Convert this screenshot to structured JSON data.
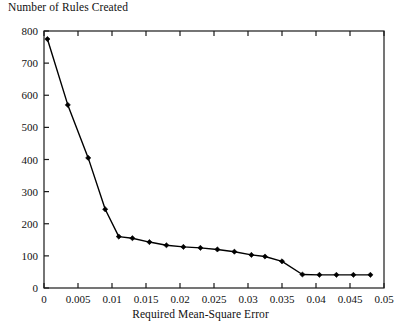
{
  "chart_data": {
    "type": "line",
    "title": "Number of Rules Created",
    "xlabel": "Required Mean-Square Error",
    "ylabel": "Number of Rules Created",
    "xlim": [
      0,
      0.05
    ],
    "ylim": [
      0,
      800
    ],
    "grid": false,
    "legend": null,
    "marker": "filled-diamond",
    "line_color": "#000000",
    "xticks": [
      0,
      0.005,
      0.01,
      0.015,
      0.02,
      0.025,
      0.03,
      0.035,
      0.04,
      0.045,
      0.05
    ],
    "xtick_labels": [
      "0",
      "0.005",
      "0.01",
      "0.015",
      "0.02",
      "0.025",
      "0.03",
      "0.035",
      "0.04",
      "0.045",
      "0.05"
    ],
    "yticks": [
      0,
      100,
      200,
      300,
      400,
      500,
      600,
      700,
      800
    ],
    "ytick_labels": [
      "0",
      "100",
      "200",
      "300",
      "400",
      "500",
      "600",
      "700",
      "800"
    ],
    "x": [
      0.0005,
      0.0035,
      0.0065,
      0.009,
      0.011,
      0.013,
      0.0155,
      0.018,
      0.0205,
      0.023,
      0.0255,
      0.028,
      0.0305,
      0.0325,
      0.035,
      0.038,
      0.0405,
      0.043,
      0.0455,
      0.048
    ],
    "values": [
      775,
      570,
      405,
      245,
      160,
      155,
      143,
      133,
      128,
      125,
      120,
      113,
      103,
      98,
      83,
      42,
      41,
      41,
      41,
      41
    ]
  },
  "axes": {
    "frame_color": "#1a1a1a",
    "background": "#ffffff"
  }
}
